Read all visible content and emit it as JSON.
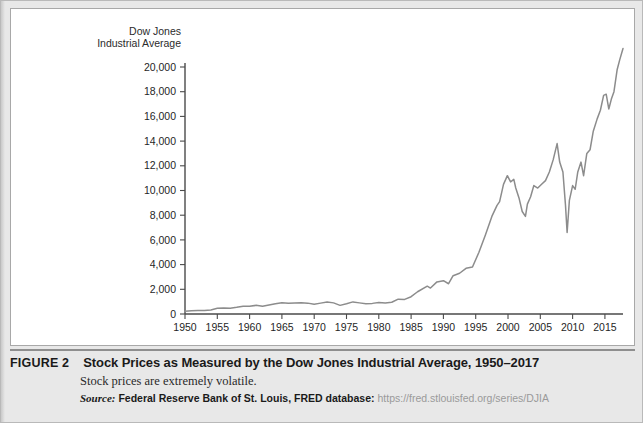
{
  "figure": {
    "label": "FIGURE 2",
    "title": "Stock Prices as Measured by the Dow Jones Industrial Average, 1950–2017",
    "subtitle": "Stock prices are extremely volatile.",
    "source_word": "Source:",
    "source_org": "Federal Reserve Bank of St. Louis, FRED database:",
    "source_url": "https://fred.stlouisfed.org/series/DJIA"
  },
  "chart_data": {
    "type": "line",
    "title": "",
    "ylabel_line1": "Dow Jones",
    "ylabel_line2": "Industrial Average",
    "xlabel": "",
    "xlim": [
      1950,
      2017.8
    ],
    "ylim": [
      0,
      20000
    ],
    "grid": false,
    "legend": "none",
    "line_color": "#8c8c8c",
    "axis_color": "#4a4a4a",
    "y_ticks": [
      0,
      2000,
      4000,
      6000,
      8000,
      10000,
      12000,
      14000,
      16000,
      18000,
      20000
    ],
    "y_tick_labels": [
      "0",
      "2,000",
      "4,000",
      "6,000",
      "8,000",
      "10,000",
      "12,000",
      "14,000",
      "16,000",
      "18,000",
      "20,000"
    ],
    "x_ticks": [
      1950,
      1955,
      1960,
      1965,
      1970,
      1975,
      1980,
      1985,
      1990,
      1995,
      2000,
      2005,
      2010,
      2015
    ],
    "x_tick_labels": [
      "1950",
      "1955",
      "1960",
      "1965",
      "1970",
      "1975",
      "1980",
      "1985",
      "1990",
      "1995",
      "2000",
      "2005",
      "2010",
      "2015"
    ],
    "series": [
      {
        "name": "Dow Jones Industrial Average",
        "x": [
          1950,
          1951,
          1952,
          1953,
          1954,
          1955,
          1956,
          1957,
          1958,
          1959,
          1960,
          1961,
          1962,
          1963,
          1964,
          1965,
          1966,
          1967,
          1968,
          1969,
          1970,
          1971,
          1972,
          1973,
          1974,
          1975,
          1976,
          1977,
          1978,
          1979,
          1980,
          1981,
          1982,
          1983,
          1984,
          1985,
          1986,
          1987.5,
          1988,
          1989,
          1990,
          1990.8,
          1991.5,
          1992.5,
          1993.5,
          1994.5,
          1995.5,
          1996.5,
          1997.5,
          1998.3,
          1998.7,
          1999.3,
          1999.9,
          2000.4,
          2000.9,
          2001.2,
          2001.7,
          2002.2,
          2002.7,
          2003.0,
          2003.5,
          2004.0,
          2004.6,
          2005.2,
          2005.8,
          2006.4,
          2007.0,
          2007.6,
          2008.0,
          2008.5,
          2008.9,
          2009.15,
          2009.5,
          2010.0,
          2010.4,
          2010.8,
          2011.3,
          2011.7,
          2012.2,
          2012.7,
          2013.2,
          2013.8,
          2014.3,
          2014.8,
          2015.2,
          2015.6,
          2016.0,
          2016.4,
          2016.9,
          2017.3,
          2017.8
        ],
        "values": [
          216,
          258,
          275,
          281,
          330,
          460,
          495,
          465,
          540,
          630,
          620,
          700,
          620,
          720,
          830,
          920,
          870,
          890,
          920,
          880,
          790,
          880,
          980,
          900,
          700,
          830,
          980,
          900,
          830,
          860,
          930,
          900,
          950,
          1200,
          1180,
          1400,
          1800,
          2250,
          2100,
          2600,
          2700,
          2450,
          3100,
          3300,
          3700,
          3800,
          5000,
          6400,
          7900,
          8800,
          9100,
          10500,
          11200,
          10700,
          10900,
          10200,
          9400,
          8300,
          7900,
          8900,
          9500,
          10400,
          10200,
          10500,
          10800,
          11500,
          12500,
          13800,
          12300,
          11500,
          8800,
          6600,
          9200,
          10400,
          10100,
          11500,
          12300,
          11200,
          13000,
          13300,
          14800,
          15800,
          16500,
          17700,
          17800,
          16600,
          17400,
          18000,
          19800,
          20600,
          21500
        ]
      }
    ],
    "annotations": [
      {
        "label": "dot-com peak",
        "x": 1999.9,
        "y": 11200
      },
      {
        "label": "2002 trough",
        "x": 2002.7,
        "y": 7900
      },
      {
        "label": "2007 peak",
        "x": 2007.6,
        "y": 13800
      },
      {
        "label": "2009 financial crisis trough",
        "x": 2009.15,
        "y": 6600
      }
    ]
  }
}
